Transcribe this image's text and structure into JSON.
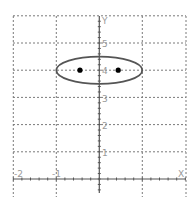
{
  "chart_data": {
    "type": "scatter",
    "title": "",
    "xlabel": "X",
    "ylabel": "Y",
    "xlim": [
      -2,
      1.33
    ],
    "ylim": [
      -0.7,
      6
    ],
    "grid": true,
    "grid_style": "dashed",
    "x_ticks": [
      -2,
      -1,
      0,
      1
    ],
    "x_tick_labels": [
      "-2",
      "-1"
    ],
    "y_ticks": [
      1,
      2,
      3,
      4,
      5
    ],
    "y_tick_labels": [
      "1",
      "2",
      "3",
      "4",
      "5"
    ],
    "minor_tick_step": 0.2,
    "shapes": [
      {
        "kind": "ellipse",
        "name": "ellipse",
        "center": [
          0,
          4
        ],
        "rx": 1,
        "ry": 0.5,
        "color": "#555555"
      }
    ],
    "points": [
      {
        "name": "focus-left",
        "x": -0.45,
        "y": 4
      },
      {
        "name": "focus-right",
        "x": 0.44,
        "y": 4
      }
    ],
    "colors": {
      "grid": "#7a7a7a",
      "axis": "#555555",
      "curve": "#555555",
      "point": "#000000",
      "label": "#9a9a9a"
    }
  },
  "labels": {
    "x_axis": "X",
    "y_axis": "Y",
    "tick_x_neg2": "-2",
    "tick_x_neg1": "-1",
    "tick_y_1": "1",
    "tick_y_2": "2",
    "tick_y_3": "3",
    "tick_y_4": "4",
    "tick_y_5": "5"
  }
}
